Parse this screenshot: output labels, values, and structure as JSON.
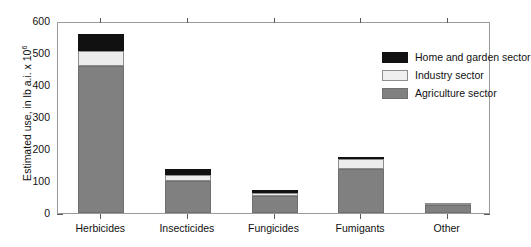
{
  "chart_data": {
    "type": "bar",
    "subtype": "stacked-bar",
    "title": "",
    "xlabel": "",
    "ylabel": "Estimated use, in lb a.i. x 10",
    "ylabel_exponent": "6",
    "ylim": [
      0,
      600
    ],
    "yticks": [
      0,
      100,
      200,
      300,
      400,
      500,
      600
    ],
    "ytick_labels": [
      "0",
      "100",
      "200",
      "300",
      "400",
      "500",
      "600"
    ],
    "minor_tick_interval": 20,
    "grid": false,
    "legend_position": "top-right",
    "categories": [
      "Herbicides",
      "Insecticides",
      "Fungicides",
      "Fumigants",
      "Other"
    ],
    "series": [
      {
        "name": "Agriculture sector",
        "color": "#808080",
        "values": [
          458,
          100,
          53,
          138,
          25
        ]
      },
      {
        "name": "Industry sector",
        "color": "#ececec",
        "values": [
          48,
          19,
          10,
          31,
          6
        ]
      },
      {
        "name": "Home and garden sector",
        "color": "#111111",
        "values": [
          54,
          18,
          9,
          3,
          0
        ]
      }
    ],
    "totals": [
      560,
      137,
      72,
      172,
      31
    ]
  },
  "legend": {
    "items": [
      {
        "label": "Home and garden sector",
        "swatch": "black-swatch"
      },
      {
        "label": "Industry sector",
        "swatch": "light-gray-swatch"
      },
      {
        "label": "Agriculture sector",
        "swatch": "gray-swatch"
      }
    ]
  },
  "axes": {
    "y_title": "Estimated use, in lb a.i. x 10",
    "y_title_sup": "6"
  }
}
